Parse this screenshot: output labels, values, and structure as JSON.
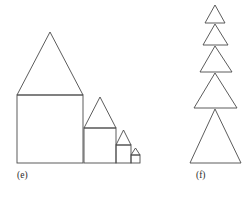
{
  "figure": {
    "background_color": "#ffffff",
    "stroke_color": "#4a4a4a",
    "panels": [
      {
        "id": "e",
        "caption": "(e)",
        "caption_x": 17,
        "caption_y": 178,
        "description": "row of four self-similar house shapes decreasing in size left to right, sharing a common baseline",
        "baseline_y": 163,
        "houses": [
          {
            "name": "house-1",
            "wall_left": 17,
            "wall_right": 83,
            "wall_top": 95,
            "wall_bottom": 163,
            "roof_peak_x": 50,
            "roof_peak_y": 32
          },
          {
            "name": "house-2",
            "wall_left": 84,
            "wall_right": 116,
            "wall_top": 128,
            "wall_bottom": 163,
            "roof_peak_x": 100,
            "roof_peak_y": 97
          },
          {
            "name": "house-3",
            "wall_left": 116,
            "wall_right": 131,
            "wall_top": 145,
            "wall_bottom": 163,
            "roof_peak_x": 123.5,
            "roof_peak_y": 130
          },
          {
            "name": "house-4",
            "wall_left": 131,
            "wall_right": 140,
            "wall_top": 155,
            "wall_bottom": 163,
            "roof_peak_x": 135.5,
            "roof_peak_y": 148
          }
        ]
      },
      {
        "id": "f",
        "caption": "(f)",
        "caption_x": 196,
        "caption_y": 178,
        "description": "vertical stack of five triangles increasing in size downward, each apex touching the base midpoint of the triangle above",
        "center_x": 215,
        "triangles": [
          {
            "name": "triangle-1",
            "apex_x": 215,
            "apex_y": 5,
            "base_y": 23,
            "base_left": 205,
            "base_right": 225
          },
          {
            "name": "triangle-2",
            "apex_x": 215,
            "apex_y": 24,
            "base_y": 45,
            "base_left": 203,
            "base_right": 228
          },
          {
            "name": "triangle-3",
            "apex_x": 215,
            "apex_y": 46,
            "base_y": 72,
            "base_left": 200,
            "base_right": 232
          },
          {
            "name": "triangle-4",
            "apex_x": 215,
            "apex_y": 73,
            "base_y": 108,
            "base_left": 194,
            "base_right": 237
          },
          {
            "name": "triangle-5",
            "apex_x": 215,
            "apex_y": 109,
            "base_y": 163,
            "base_left": 190,
            "base_right": 241
          }
        ]
      }
    ]
  }
}
